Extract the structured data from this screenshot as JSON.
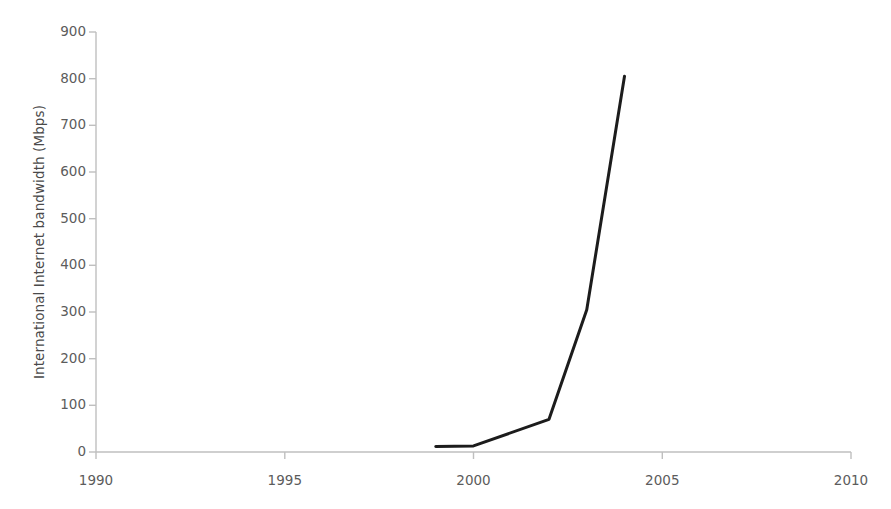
{
  "chart_data": {
    "type": "line",
    "title": "",
    "subtitle": "",
    "xlabel": "",
    "ylabel": "International Internet bandwidth (Mbps)",
    "x": [
      1999,
      2000,
      2002,
      2003,
      2004
    ],
    "values": [
      12,
      13,
      70,
      305,
      805
    ],
    "series": [
      {
        "name": "International Internet bandwidth",
        "x": [
          1999,
          2000,
          2002,
          2003,
          2004
        ],
        "values": [
          12,
          13,
          70,
          305,
          805
        ]
      }
    ],
    "xlim": [
      1990,
      2010
    ],
    "ylim": [
      0,
      900
    ],
    "xticks": [
      1990,
      1995,
      2000,
      2005,
      2010
    ],
    "yticks": [
      0,
      100,
      200,
      300,
      400,
      500,
      600,
      700,
      800,
      900
    ],
    "xtick_labels": [
      "1990",
      "1995",
      "2000",
      "2005",
      "2010"
    ],
    "ytick_labels": [
      "0",
      "100",
      "200",
      "300",
      "400",
      "500",
      "600",
      "700",
      "800",
      "900"
    ],
    "grid": false,
    "legend": false,
    "legend_position": "none",
    "markers": false,
    "annotations": [],
    "line_color": "#1c1c1c",
    "line_width": 3,
    "axis_color": "#bfbfbf",
    "tick_label_color": "#5c5c5c",
    "axis_label_color": "#4a4a4a",
    "background_color": "#ffffff"
  },
  "axes": {
    "y_axis_title": "International Internet bandwidth (Mbps)",
    "x_axis_title": ""
  }
}
